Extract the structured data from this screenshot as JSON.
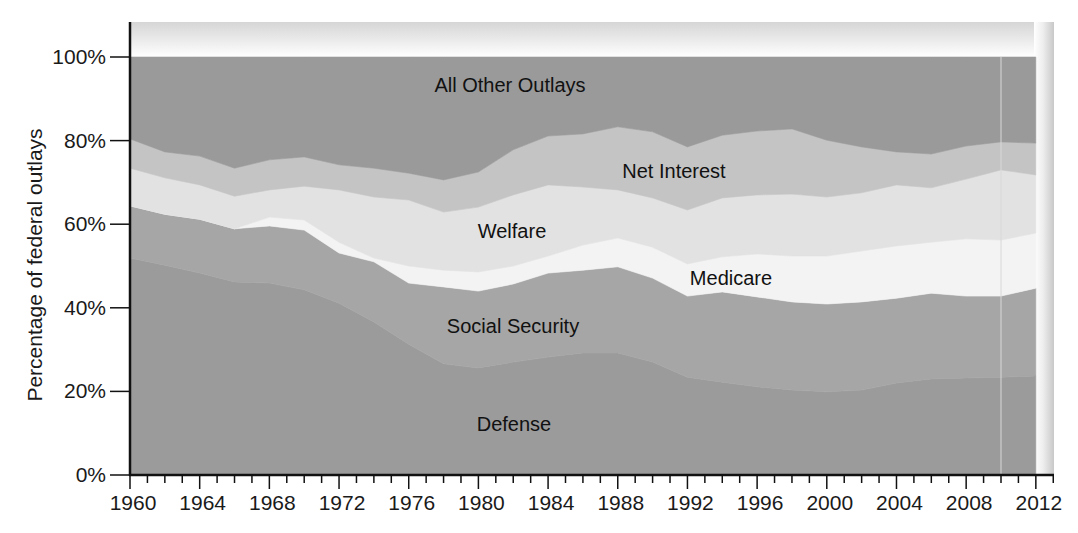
{
  "chart_data": {
    "type": "area",
    "stacked": true,
    "percent_stacked": true,
    "title": "",
    "xlabel": "",
    "ylabel": "Percentage of federal outlays",
    "ylim": [
      0,
      100
    ],
    "xlim": [
      1960,
      2013
    ],
    "grid": false,
    "legend": "inline labels",
    "y_ticks": [
      {
        "value": 0,
        "label": "0%"
      },
      {
        "value": 20,
        "label": "20%"
      },
      {
        "value": 40,
        "label": "40%"
      },
      {
        "value": 60,
        "label": "60%"
      },
      {
        "value": 80,
        "label": "80%"
      },
      {
        "value": 100,
        "label": "100%"
      }
    ],
    "x_tick_labels": [
      "1960",
      "1964",
      "1968",
      "1972",
      "1976",
      "1980",
      "1984",
      "1988",
      "1992",
      "1996",
      "2000",
      "2004",
      "2008",
      "2012"
    ],
    "x_minor_tick_step": 1,
    "x_label_step": 4,
    "x": [
      1960,
      1962,
      1964,
      1966,
      1968,
      1970,
      1972,
      1974,
      1976,
      1978,
      1980,
      1982,
      1984,
      1986,
      1988,
      1990,
      1992,
      1994,
      1996,
      1998,
      2000,
      2002,
      2004,
      2006,
      2008,
      2010,
      2012
    ],
    "series": [
      {
        "name": "Defense",
        "color": "#9b9b9b",
        "values": [
          51.9,
          50.2,
          48.3,
          46.2,
          45.9,
          44.3,
          41.1,
          36.6,
          31.3,
          26.6,
          25.6,
          27.0,
          28.2,
          29.2,
          29.2,
          27.0,
          23.4,
          22.2,
          21.1,
          20.3,
          19.9,
          20.3,
          22.0,
          23.0,
          23.2,
          23.4,
          23.7
        ]
      },
      {
        "name": "Social Security",
        "color": "#a6a6a6",
        "values": [
          12.5,
          12.2,
          12.9,
          12.7,
          13.7,
          14.3,
          12.0,
          14.4,
          14.6,
          18.4,
          18.4,
          18.7,
          20.1,
          19.8,
          20.6,
          20.1,
          19.4,
          21.6,
          21.5,
          21.1,
          21.0,
          21.1,
          20.3,
          20.5,
          19.6,
          19.4,
          21.0
        ]
      },
      {
        "name": "Medicare",
        "color": "#f3f3f3",
        "values": [
          0,
          0,
          0,
          0,
          2.1,
          2.4,
          2.6,
          0.9,
          4.1,
          4.0,
          4.6,
          4.3,
          4.1,
          6.0,
          6.9,
          7.4,
          7.7,
          8.4,
          10.3,
          11.0,
          11.5,
          12.2,
          12.5,
          12.2,
          13.7,
          13.4,
          13.2
        ]
      },
      {
        "name": "Welfare",
        "color": "#e2e2e2",
        "values": [
          9.0,
          8.7,
          8.2,
          7.8,
          6.5,
          8.1,
          12.5,
          14.6,
          15.8,
          13.9,
          15.5,
          17.0,
          17.0,
          13.9,
          11.5,
          11.8,
          12.9,
          14.1,
          14.1,
          14.8,
          14.1,
          13.9,
          14.6,
          13.0,
          14.3,
          16.8,
          13.9
        ]
      },
      {
        "name": "Net Interest",
        "color": "#c4c4c4",
        "values": [
          7.0,
          6.2,
          6.9,
          6.7,
          7.2,
          7.0,
          6.0,
          6.9,
          6.4,
          7.7,
          8.4,
          10.8,
          11.7,
          12.7,
          15.1,
          15.8,
          15.1,
          15.0,
          15.3,
          15.6,
          13.6,
          11.0,
          7.9,
          8.1,
          7.9,
          6.7,
          7.6
        ]
      },
      {
        "name": "All Other Outlays",
        "color": "#9a9a9a",
        "values": [
          19.6,
          22.7,
          23.7,
          26.6,
          24.6,
          23.9,
          25.8,
          26.6,
          27.8,
          29.4,
          27.5,
          22.2,
          18.9,
          18.4,
          16.7,
          17.9,
          21.5,
          18.7,
          17.7,
          17.2,
          19.9,
          21.5,
          22.7,
          23.2,
          21.3,
          20.3,
          20.6
        ]
      }
    ],
    "cumulative_boundaries": {
      "defense_top": [
        51.9,
        50.2,
        48.3,
        46.2,
        45.9,
        44.3,
        41.1,
        36.6,
        31.3,
        26.6,
        25.6,
        27.0,
        28.2,
        29.2,
        29.2,
        27.0,
        23.4,
        22.2,
        21.1,
        20.3,
        19.9,
        20.3,
        22.0,
        23.0,
        23.2,
        23.4,
        23.7
      ],
      "social_security_top": [
        64.4,
        62.4,
        61.2,
        58.9,
        59.6,
        58.6,
        53.1,
        51.0,
        45.9,
        45.0,
        44.0,
        45.7,
        48.3,
        49.0,
        49.8,
        47.1,
        42.8,
        43.8,
        42.6,
        41.4,
        40.9,
        41.4,
        42.3,
        43.5,
        42.8,
        42.8,
        44.7
      ],
      "medicare_top": [
        64.4,
        62.4,
        61.2,
        58.9,
        61.7,
        61.0,
        55.7,
        51.9,
        50.0,
        49.0,
        48.6,
        50.0,
        52.4,
        55.0,
        56.7,
        54.5,
        50.5,
        52.2,
        52.9,
        52.4,
        52.4,
        53.6,
        54.8,
        55.7,
        56.5,
        56.2,
        57.9
      ],
      "welfare_top": [
        73.4,
        71.1,
        69.4,
        66.7,
        68.2,
        69.1,
        68.2,
        66.5,
        65.8,
        62.9,
        64.1,
        67.0,
        69.4,
        68.9,
        68.2,
        66.3,
        63.4,
        66.3,
        67.0,
        67.2,
        66.5,
        67.5,
        69.4,
        68.7,
        70.8,
        73.0,
        71.8
      ],
      "net_interest_top": [
        80.4,
        77.3,
        76.3,
        73.4,
        75.4,
        76.1,
        74.2,
        73.4,
        72.2,
        70.6,
        72.5,
        77.8,
        81.1,
        81.6,
        83.3,
        82.1,
        78.5,
        81.3,
        82.3,
        82.8,
        80.1,
        78.5,
        77.3,
        76.8,
        78.7,
        79.7,
        79.4
      ],
      "all_other_top": [
        100,
        100,
        100,
        100,
        100,
        100,
        100,
        100,
        100,
        100,
        100,
        100,
        100,
        100,
        100,
        100,
        100,
        100,
        100,
        100,
        100,
        100,
        100,
        100,
        100,
        100,
        100
      ]
    },
    "annotations": [
      {
        "text": "All Other Outlays",
        "x": 1976.5,
        "y": 89
      },
      {
        "text": "Net Interest",
        "x": 1990.5,
        "y": 74.5
      },
      {
        "text": "Welfare",
        "x": 1977.5,
        "y": 58.5
      },
      {
        "text": "Medicare",
        "x": 1995,
        "y": 46.5
      },
      {
        "text": "Social Security",
        "x": 1977.5,
        "y": 35.5
      },
      {
        "text": "Defense",
        "x": 1977.5,
        "y": 12.5
      }
    ],
    "projection_marker_year": 2010
  }
}
